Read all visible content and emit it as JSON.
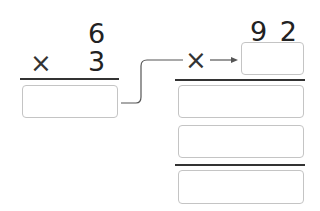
{
  "left_problem": {
    "multiplicand": "6",
    "multiplier": "3",
    "operator": "×",
    "answer_value": ""
  },
  "right_problem": {
    "multiplicand": "9 2",
    "operator": "×",
    "multiplier_value": "",
    "partial_product_1": "",
    "partial_product_2": "",
    "final_answer": ""
  },
  "colors": {
    "text": "#222222",
    "box_border": "#c4c4c4",
    "rule": "#333333",
    "connector": "#555555"
  }
}
